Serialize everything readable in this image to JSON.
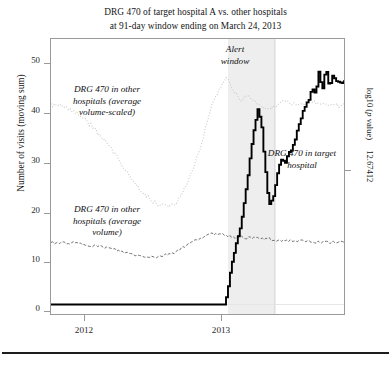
{
  "title": {
    "line1": "DRG 470 of target hospital A vs. other hospitals",
    "line2": "at 91-day window ending on March 24, 2013"
  },
  "axes": {
    "y_left_label": "Number of visits (moving sum)",
    "y_left_ticks": [
      "50",
      "40",
      "30",
      "20",
      "10",
      "0"
    ],
    "y_right_label_prefix": "log10 (",
    "y_right_label_italic": "p",
    "y_right_label_suffix": " value)",
    "y_right_tick": "12.67412",
    "x_ticks": [
      "2012",
      "2013"
    ]
  },
  "annotations": {
    "alert_window": "Alert\nwindow",
    "other_scaled": "DRG 470 in other\nhospitals (average\nvolume-scaled)",
    "other_avg": "DRG 470 in other\nhospitals (average\nvolume)",
    "target": "DRG 470 in target\nhospital"
  },
  "colors": {
    "target_line": "#000000",
    "other_scaled_line": "#c9c9c9",
    "other_avg_line": "#6f6f6f",
    "alert_band": "#eeeeee",
    "frame": "#9a9a9a"
  },
  "chart_data": {
    "type": "line",
    "title": "DRG 470 of target hospital A vs. other hospitals at 91-day window ending on March 24, 2013",
    "xlabel": "",
    "ylabel": "Number of visits (moving sum)",
    "y2label": "log10 (p value)",
    "xlim": [
      2011.82,
      2013.55
    ],
    "ylim": [
      -2,
      56
    ],
    "grid": false,
    "legend": "annotations-inline",
    "x_tick_values": [
      2012,
      2013
    ],
    "y_tick_values": [
      0,
      10,
      20,
      30,
      40,
      50
    ],
    "y2_tick_values": [
      12.67412
    ],
    "annotation_bands": [
      {
        "name": "Alert window",
        "x_start": 2012.86,
        "x_end": 2013.14,
        "color": "#eeeeee"
      }
    ],
    "series": [
      {
        "name": "DRG 470 in target hospital",
        "style": "solid",
        "color": "#000000",
        "x": [
          2011.88,
          2012.0,
          2012.2,
          2012.4,
          2012.55,
          2012.68,
          2012.76,
          2012.8,
          2012.83,
          2012.85,
          2012.86,
          2012.87,
          2012.88,
          2012.9,
          2012.92,
          2012.94,
          2012.96,
          2012.98,
          2013.0,
          2013.02,
          2013.04,
          2013.05,
          2013.06,
          2013.07,
          2013.08,
          2013.09,
          2013.1,
          2013.11,
          2013.12,
          2013.14,
          2013.16,
          2013.18,
          2013.2,
          2013.22,
          2013.24,
          2013.26,
          2013.28,
          2013.3,
          2013.32,
          2013.34,
          2013.36,
          2013.38,
          2013.4,
          2013.42,
          2013.44,
          2013.46,
          2013.48,
          2013.5
        ],
        "y": [
          0,
          0,
          0,
          0,
          0,
          0,
          0,
          0,
          0,
          1,
          3,
          5,
          8,
          11,
          14,
          17,
          22,
          27,
          33,
          38,
          41,
          40,
          38,
          34,
          30,
          26,
          23,
          21,
          22,
          24,
          29,
          31,
          30,
          32,
          33,
          35,
          38,
          40,
          42,
          43,
          46,
          44,
          49,
          45,
          50,
          46,
          48,
          47
        ]
      },
      {
        "name": "DRG 470 in other hospitals (average volume-scaled)",
        "style": "dotted",
        "color": "#c9c9c9",
        "x": [
          2011.88,
          2011.95,
          2012.05,
          2012.15,
          2012.25,
          2012.35,
          2012.45,
          2012.55,
          2012.62,
          2012.7,
          2012.76,
          2012.82,
          2012.86,
          2012.9,
          2012.94,
          2012.98,
          2013.02,
          2013.06,
          2013.1,
          2013.14,
          2013.18,
          2013.22,
          2013.26,
          2013.3,
          2013.36,
          2013.42,
          2013.48,
          2013.5
        ],
        "y": [
          42,
          41,
          38,
          34,
          29,
          24,
          21,
          21,
          25,
          33,
          41,
          46,
          48,
          45,
          43,
          44,
          43,
          42,
          41,
          42,
          43,
          43,
          42,
          42,
          43,
          42,
          42,
          42
        ]
      },
      {
        "name": "DRG 470 in other hospitals (average volume)",
        "style": "dashed",
        "color": "#6f6f6f",
        "x": [
          2011.88,
          2011.95,
          2012.05,
          2012.15,
          2012.25,
          2012.35,
          2012.45,
          2012.55,
          2012.62,
          2012.7,
          2012.76,
          2012.82,
          2012.86,
          2012.9,
          2012.94,
          2012.98,
          2013.02,
          2013.06,
          2013.1,
          2013.14,
          2013.2,
          2013.26,
          2013.32,
          2013.38,
          2013.44,
          2013.5
        ],
        "y": [
          13,
          13,
          12.5,
          12,
          11,
          10.2,
          10,
          11,
          12.5,
          14,
          14.8,
          15,
          14.6,
          14.2,
          14.4,
          14,
          14.2,
          13.8,
          13.9,
          13.6,
          13.5,
          13.4,
          13.3,
          13.2,
          13.1,
          13.1
        ]
      }
    ]
  }
}
